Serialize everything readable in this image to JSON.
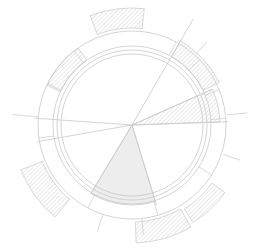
{
  "figure": {
    "title": "",
    "type": "polar-rose-diagram",
    "background_color": "#ffffff",
    "stroke_color": "#c9c9c9",
    "hatch_color": "#d6d6d6",
    "fill_color": "#ededed",
    "width": 262,
    "height": 249
  },
  "geometry": {
    "center_x": 132,
    "center_y": 125,
    "outer_ring_outer_radius": 94,
    "outer_ring_inner_radius": 79,
    "inner_circle_radius": 71,
    "mid_circle_radius": 75
  },
  "chart_data": {
    "type": "pie",
    "title": "",
    "subtitle": "",
    "xlabel": "",
    "ylabel": "",
    "grid": false,
    "legend_position": "none",
    "angle_units": "degrees",
    "angle_zero": "east",
    "angle_direction": "clockwise",
    "categories": [
      "sector-a",
      "sector-b",
      "sector-c",
      "sector-d",
      "sector-e"
    ],
    "values": [
      13,
      47,
      104,
      119,
      77
    ],
    "wedges": [
      {
        "name": "wedge-right-hatched",
        "start_angle": -24,
        "end_angle": -2,
        "radius": 88,
        "style": "hatched",
        "label": ""
      },
      {
        "name": "wedge-bottom-filled",
        "start_angle": 73,
        "end_angle": 121,
        "radius": 80,
        "style": "filled",
        "label": ""
      }
    ],
    "spokes": [
      {
        "name": "spoke-upper-right",
        "angle": -60,
        "length": 122
      },
      {
        "name": "spoke-left-upper",
        "angle": 184,
        "length": 98
      },
      {
        "name": "spoke-left-lower",
        "angle": 170,
        "length": 96
      },
      {
        "name": "spoke-right",
        "angle": -2,
        "length": 96
      },
      {
        "name": "spoke-right-lower",
        "angle": -24,
        "length": 88
      },
      {
        "name": "spoke-bottom-left",
        "angle": 121,
        "length": 80
      },
      {
        "name": "spoke-bottom-right",
        "angle": 73,
        "length": 84
      }
    ],
    "ring_dividers": [
      {
        "name": "divider-ne-1",
        "angle": -62
      },
      {
        "name": "divider-ne-2",
        "angle": -44
      },
      {
        "name": "divider-e-1",
        "angle": -22
      },
      {
        "name": "divider-e-2",
        "angle": -4
      },
      {
        "name": "divider-se-1",
        "angle": 32
      },
      {
        "name": "divider-s-1",
        "angle": 74
      },
      {
        "name": "divider-sw-1",
        "angle": 118
      },
      {
        "name": "divider-w-1",
        "angle": 172
      },
      {
        "name": "divider-nw-1",
        "angle": 206
      },
      {
        "name": "divider-nw-2",
        "angle": 232
      }
    ],
    "ring_segments": [
      {
        "name": "ring-segment-nw-hatched",
        "start_angle": 205,
        "end_angle": 235,
        "inner_radius": 79,
        "outer_radius": 94,
        "style": "hatched"
      },
      {
        "name": "ring-segment-ne-hatched",
        "start_angle": -60,
        "end_angle": -26,
        "inner_radius": 79,
        "outer_radius": 97,
        "style": "hatched"
      }
    ],
    "outer_arcs": [
      {
        "name": "outer-arc-north-hatched",
        "start_angle": 249,
        "end_angle": 276,
        "inner_radius": 97,
        "outer_radius": 117,
        "style": "hatched"
      },
      {
        "name": "outer-arc-southwest-hatched",
        "start_angle": 130,
        "end_angle": 158,
        "inner_radius": 97,
        "outer_radius": 120,
        "style": "hatched"
      },
      {
        "name": "outer-arc-south-hatched",
        "start_angle": 60,
        "end_angle": 88,
        "inner_radius": 97,
        "outer_radius": 118,
        "style": "hatched"
      },
      {
        "name": "outer-arc-southeast-hatched",
        "start_angle": 36,
        "end_angle": 58,
        "inner_radius": 99,
        "outer_radius": 115,
        "style": "hatched"
      }
    ],
    "tick_marks": [
      {
        "name": "tick-east",
        "angle": -6,
        "inner_radius": 96,
        "outer_radius": 116
      },
      {
        "name": "tick-east-lower",
        "angle": 18,
        "inner_radius": 96,
        "outer_radius": 114
      },
      {
        "name": "tick-northeast",
        "angle": -48,
        "inner_radius": 96,
        "outer_radius": 112
      },
      {
        "name": "tick-west",
        "angle": 185,
        "inner_radius": 94,
        "outer_radius": 120
      },
      {
        "name": "tick-southwest",
        "angle": 108,
        "inner_radius": 94,
        "outer_radius": 112
      },
      {
        "name": "tick-south",
        "angle": 84,
        "inner_radius": 94,
        "outer_radius": 110
      }
    ]
  }
}
